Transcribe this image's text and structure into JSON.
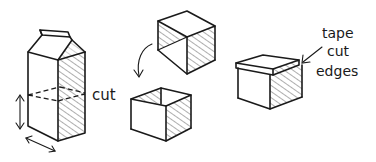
{
  "diagram": {
    "steps": [
      {
        "id": "carton",
        "label": "cut",
        "note": "Milk carton with dashed cut line; arrows indicate height and width measurement"
      },
      {
        "id": "halves",
        "note": "Top piece (cube) flipped down over bottom piece (open box)"
      },
      {
        "id": "finished-box",
        "label_lines": [
          "tape",
          "cut",
          "edges"
        ],
        "note": "Lidded box with taped cut edges"
      }
    ],
    "labels": {
      "cut": "cut",
      "tape_line1": "tape",
      "tape_line2": "cut",
      "tape_line3": "edges"
    },
    "colors": {
      "ink": "#1a1a1a",
      "background": "#ffffff"
    }
  }
}
